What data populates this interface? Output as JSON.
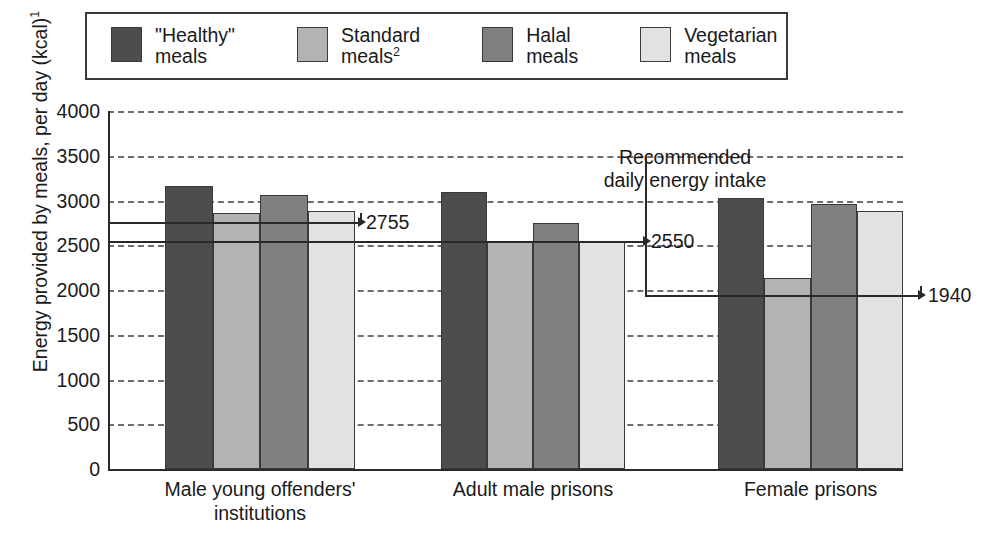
{
  "legend": {
    "items": [
      {
        "label": "\"Healthy\"\nmeals",
        "color": "#4d4d4d",
        "name": "healthy-meals"
      },
      {
        "label": "Standard\nmeals",
        "sup": "2",
        "color": "#b3b3b3",
        "name": "standard-meals"
      },
      {
        "label": "Halal\nmeals",
        "color": "#808080",
        "name": "halal-meals"
      },
      {
        "label": "Vegetarian\nmeals",
        "color": "#e2e2e2",
        "name": "vegetarian-meals"
      }
    ]
  },
  "axis": {
    "y_label": "Energy provided by meals, per day (kcal)",
    "y_label_sup": "1",
    "y_ticks": [
      "4000",
      "3500",
      "3000",
      "2500",
      "2000",
      "1500",
      "1000",
      "500",
      "0"
    ]
  },
  "annotations": {
    "recommended_intake": "Recommended\ndaily energy intake",
    "values": [
      {
        "label": "2755",
        "value": 2755,
        "group": "Male young offenders' institutions"
      },
      {
        "label": "2550",
        "value": 2550,
        "group": "Adult male prisons"
      },
      {
        "label": "1940",
        "value": 1940,
        "group": "Female prisons"
      }
    ]
  },
  "chart_data": {
    "type": "bar",
    "title": "",
    "xlabel": "",
    "ylabel": "Energy provided by meals, per day (kcal)1",
    "ylim": [
      0,
      4000
    ],
    "ytick_step": 500,
    "grid": true,
    "legend_position": "top",
    "categories": [
      "Male young  offenders'\ninstitutions",
      "Adult male prisons",
      "Female prisons"
    ],
    "series": [
      {
        "name": "\"Healthy\" meals",
        "color": "#4d4d4d",
        "values": [
          3160,
          3100,
          3030
        ]
      },
      {
        "name": "Standard meals2",
        "color": "#b3b3b3",
        "values": [
          2860,
          2550,
          2130
        ]
      },
      {
        "name": "Halal meals",
        "color": "#808080",
        "values": [
          3060,
          2750,
          2960
        ]
      },
      {
        "name": "Vegetarian meals",
        "color": "#e2e2e2",
        "values": [
          2880,
          2550,
          2880
        ]
      }
    ],
    "reference_lines": [
      {
        "label": "2755",
        "value": 2755,
        "group_index": 0
      },
      {
        "label": "2550",
        "value": 2550,
        "group_index": 1
      },
      {
        "label": "1940",
        "value": 1940,
        "group_index": 2
      }
    ]
  }
}
